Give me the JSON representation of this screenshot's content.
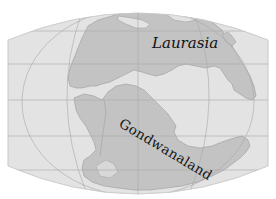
{
  "map": {
    "title": "Laurasia and Gondwanaland",
    "projection": "pseudo-cylindrical world map",
    "colors": {
      "background": "#ffffff",
      "ocean": "#e3e3e3",
      "land": "#c3c3c3",
      "coastline": "#9a9a9a",
      "gridline": "#a8a8a8",
      "label": "#111111"
    },
    "labels": [
      {
        "id": "laurasia",
        "text": "Laurasia"
      },
      {
        "id": "gondwanaland",
        "text": "Gondwanaland"
      }
    ],
    "landmasses": [
      "Laurasia",
      "Gondwanaland"
    ]
  }
}
